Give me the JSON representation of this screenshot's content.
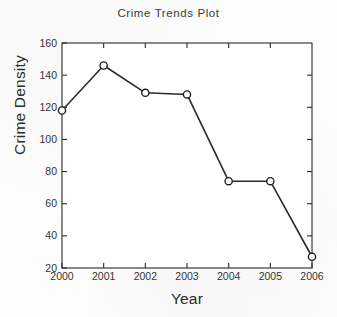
{
  "figure": {
    "background_color": "#fdfdfd",
    "axes_color": "#2b2b2b"
  },
  "chart_data": {
    "type": "line",
    "title": "Crime Trends Plot",
    "xlabel": "Year",
    "ylabel": "Crime Density",
    "categories": [
      "2000",
      "2001",
      "2002",
      "2003",
      "2004",
      "2005",
      "2006"
    ],
    "x": [
      2000,
      2001,
      2002,
      2003,
      2004,
      2005,
      2006
    ],
    "values": [
      118,
      146,
      129,
      128,
      74,
      74,
      27
    ],
    "series": [
      {
        "name": "Crime Density",
        "values": [
          118,
          146,
          129,
          128,
          74,
          74,
          27
        ]
      }
    ],
    "xlim": [
      2000,
      2006
    ],
    "ylim": [
      20,
      160
    ],
    "x_tick_labels": [
      "2000",
      "2001",
      "2002",
      "2003",
      "2004",
      "2005",
      "2006"
    ],
    "y_tick_labels": [
      "20",
      "40",
      "60",
      "80",
      "100",
      "120",
      "140",
      "160"
    ],
    "y_ticks": [
      20,
      40,
      60,
      80,
      100,
      120,
      140,
      160
    ],
    "grid": false,
    "legend": false,
    "legend_position": "none",
    "marker": "open-circle",
    "line_color": "#2b2b2b",
    "marker_face_color": "#ffffff",
    "marker_edge_color": "#1f1f1f",
    "line_width": 1.6,
    "box_frame": true,
    "tick_direction": "in"
  }
}
